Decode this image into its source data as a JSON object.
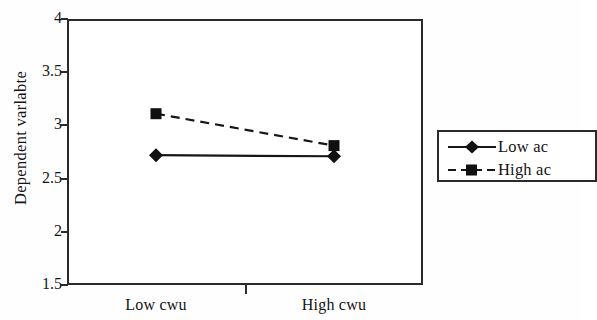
{
  "chart_data": {
    "type": "line",
    "title": "",
    "subtitle": "",
    "xlabel": "",
    "ylabel": "Dependent varlabte",
    "categories": [
      "Low cwu",
      "High cwu"
    ],
    "xtick_labels": [
      "Low cwu",
      "High cwu"
    ],
    "ytick_labels": [
      "4",
      "3.5",
      "3",
      "2.5",
      "2",
      "1.5"
    ],
    "ytick_values": [
      4,
      3.5,
      3,
      2.5,
      2,
      1.5
    ],
    "ylim": [
      1.5,
      4
    ],
    "grid": false,
    "legend_position": "right",
    "series": [
      {
        "name": "Low ac",
        "values": [
          2.72,
          2.71
        ],
        "marker": "diamond",
        "linestyle": "solid",
        "color": "#161616"
      },
      {
        "name": "High ac",
        "values": [
          3.11,
          2.81
        ],
        "marker": "square",
        "linestyle": "dashed",
        "color": "#161616"
      }
    ]
  },
  "axes": {
    "y_title": "Dependent varlabte",
    "y_ticks": [
      {
        "label": "4",
        "value": 4
      },
      {
        "label": "3.5",
        "value": 3.5
      },
      {
        "label": "3",
        "value": 3
      },
      {
        "label": "2.5",
        "value": 2.5
      },
      {
        "label": "2",
        "value": 2
      },
      {
        "label": "1.5",
        "value": 1.5
      }
    ],
    "x_ticks": [
      {
        "label": "Low cwu"
      },
      {
        "label": "High cwu"
      }
    ]
  },
  "legend": {
    "entries": [
      {
        "label": "Low ac",
        "marker": "diamond-marker-icon",
        "linestyle": "solid"
      },
      {
        "label": "High ac",
        "marker": "square-marker-icon",
        "linestyle": "dashed"
      }
    ]
  },
  "colors": {
    "ink": "#161616",
    "axis": "#2a2a2a",
    "background": "#ffffff"
  }
}
